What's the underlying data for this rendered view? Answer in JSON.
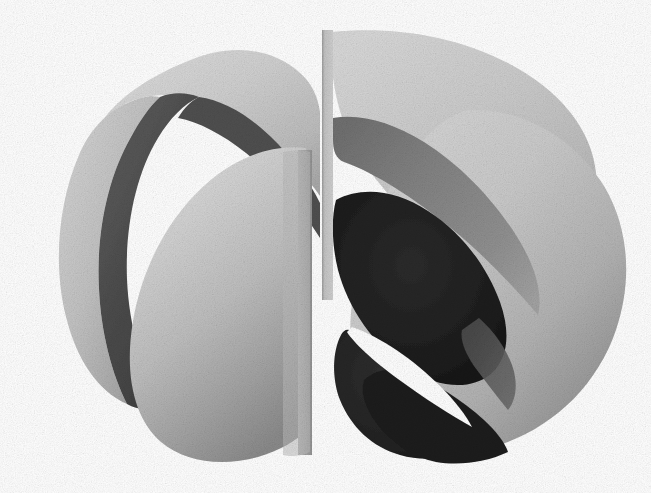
{
  "figure": {
    "title": "Four-lobed cut surface render",
    "domain": "Natural-Image",
    "width": 651,
    "height": 493,
    "background_color": "#ffffff",
    "render_style": "grayscale shaded 3D surface, matte diffuse shading, visible raster grain",
    "caption": ""
  },
  "palette": {
    "background": "#ffffff",
    "highlight_light": "#d9d9d9",
    "light": "#cdcdcd",
    "light_mid": "#c2c2c2",
    "mid": "#a9a9a9",
    "mid_gray": "#8d8d8d",
    "mid_dark": "#6e6e6e",
    "dark": "#4d4d4d",
    "darker": "#343434",
    "darkest": "#1b1b1b",
    "near_black": "#121212"
  },
  "geometry": {
    "description": "Closed four-lobed surface of revolution sliced by a vertical plane near the horizontal centre; the near half is removed revealing concave dark interiors of the far lobes.",
    "cut_plane_x": 330,
    "cut_gap_left_x": 306,
    "cut_gap_right_x": 331,
    "center": {
      "x": 322,
      "y": 252
    },
    "bounding_box": {
      "left": 33,
      "top": 27,
      "right": 629,
      "bottom": 469
    }
  },
  "chart_data": {
    "type": "surface",
    "title": "Four-lobed cut surface render",
    "xlabel": "",
    "ylabel": "",
    "grid": false,
    "legend": "none",
    "regions": [
      {
        "name": "upper-left-lobe-outer",
        "shade": "#cdcdcd",
        "tone": "light"
      },
      {
        "name": "upper-left-lobe-inner-shadow",
        "shade": "#4d4d4d",
        "tone": "dark"
      },
      {
        "name": "left-rim-crescent",
        "shade": "#b6b6b6",
        "tone": "light-mid"
      },
      {
        "name": "front-left-lobe",
        "shade": "#c7c7c7",
        "tone": "light gradient to #8a8a8a"
      },
      {
        "name": "cut-face-strip",
        "shade": "#9a9a9a",
        "tone": "mid"
      },
      {
        "name": "upper-right-lobe-outer",
        "shade": "#cfcfcf",
        "tone": "light"
      },
      {
        "name": "upper-right-crescent-shadow",
        "shade": "#8d8d8d",
        "tone": "mid"
      },
      {
        "name": "right-inner-cavity",
        "shade": "#1b1b1b",
        "tone": "near-black"
      },
      {
        "name": "lower-right-inner-cavity",
        "shade": "#232323",
        "tone": "near-black"
      },
      {
        "name": "right-outer-lobe",
        "shade": "#c9c9c9",
        "tone": "light gradient to #7d7d7d"
      },
      {
        "name": "background",
        "shade": "#ffffff",
        "tone": "white"
      }
    ]
  }
}
